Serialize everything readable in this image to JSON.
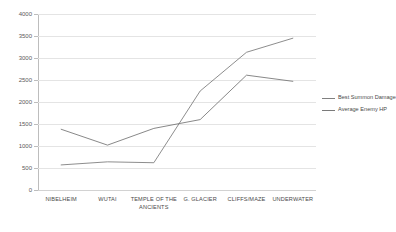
{
  "chart_data": {
    "type": "line",
    "title": "",
    "xlabel": "",
    "ylabel": "",
    "ylim": [
      0,
      4000
    ],
    "ytick_step": 500,
    "yticks": [
      "0",
      "500",
      "1000",
      "1500",
      "2000",
      "2500",
      "3000",
      "3500",
      "4000"
    ],
    "grid": true,
    "legend_position": "right",
    "categories": [
      "NIBELHEIM",
      "WUTAI",
      "TEMPLE OF THE ANCIENTS",
      "G. GLACIER",
      "CLIFFS/MAZE",
      "UNDERWATER"
    ],
    "series": [
      {
        "name": "Best Summon Damage",
        "color": "#808080",
        "values": [
          570,
          640,
          620,
          2250,
          3130,
          3450
        ]
      },
      {
        "name": "Average Enemy HP",
        "color": "#7a7a7a",
        "values": [
          1380,
          1020,
          1400,
          1600,
          2610,
          2470
        ]
      }
    ]
  },
  "legend": {
    "entries": [
      {
        "label": "Best Summon Damage"
      },
      {
        "label": "Average Enemy HP"
      }
    ]
  },
  "colors": {
    "grid": "#e4e4e4",
    "axis": "#bdbdbd",
    "text": "#4a4a4a",
    "series_a": "#808080",
    "series_b": "#7a7a7a"
  }
}
